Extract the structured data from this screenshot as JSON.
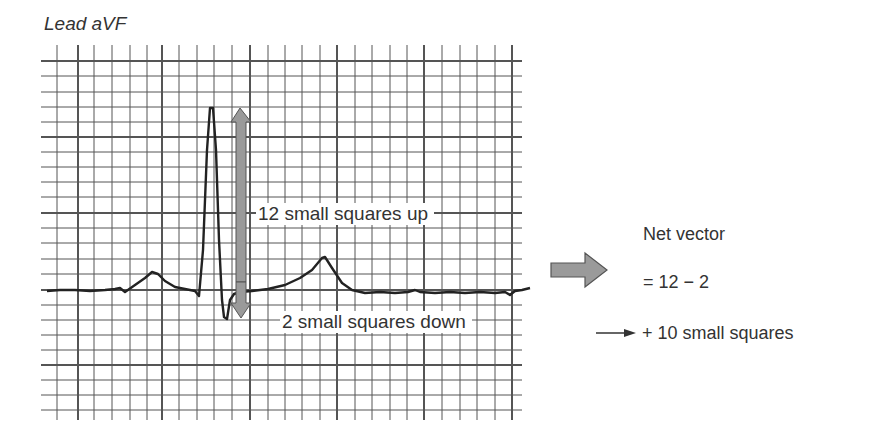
{
  "figure": {
    "lead_label": "Lead aVF",
    "annotations": {
      "up": "12 small squares up",
      "down": "2 small squares down"
    },
    "net_vector": {
      "title": "Net vector",
      "equation": "= 12 − 2",
      "result": "+ 10 small squares"
    },
    "icons": {
      "up_down_arrow": "double-headed-vertical-arrow",
      "block_arrow": "right-block-arrow",
      "line_arrow": "small-right-arrow"
    },
    "colors": {
      "grid": "#555555",
      "trace": "#222222",
      "arrow_fill": "#9a9a9a",
      "arrow_stroke": "#555555",
      "text": "#333333"
    },
    "measurements": {
      "r_wave_small_squares_up": 12,
      "s_wave_small_squares_down": 2,
      "net_small_squares": 10
    }
  }
}
